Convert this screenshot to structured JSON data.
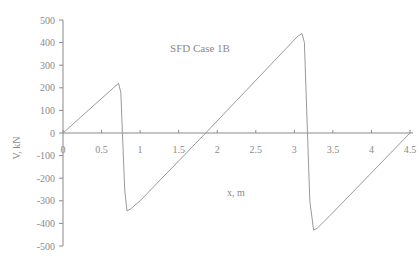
{
  "chart_data": {
    "type": "line",
    "title": "SFD Case 1B",
    "xlabel": "x, m",
    "ylabel": "V, kN",
    "xlim": [
      0,
      4.5
    ],
    "ylim": [
      -500,
      500
    ],
    "x_ticks": [
      0,
      0.5,
      1,
      1.5,
      2,
      2.5,
      3,
      3.5,
      4,
      4.5
    ],
    "x_tick_labels": [
      "0",
      "0.5",
      "1",
      "1.5",
      "2",
      "2.5",
      "3",
      "3.5",
      "4",
      "4.5"
    ],
    "y_ticks": [
      500,
      400,
      300,
      200,
      100,
      0,
      -100,
      -200,
      -300,
      -400,
      -500
    ],
    "y_tick_labels": [
      "500",
      "400",
      "300",
      "200",
      "100",
      "0",
      "-100",
      "-200",
      "-300",
      "-400",
      "-500"
    ],
    "grid": false,
    "legend": null,
    "series": [
      {
        "name": "SFD Case 1B",
        "color": "#9a9a9a",
        "x": [
          0,
          0.72,
          0.75,
          0.8,
          0.83,
          0.88,
          1.0,
          1.85,
          3.05,
          3.1,
          3.13,
          3.2,
          3.25,
          3.3,
          3.45,
          4.5
        ],
        "y": [
          0,
          220,
          180,
          -250,
          -345,
          -335,
          -300,
          0,
          430,
          440,
          400,
          -300,
          -430,
          -420,
          -370,
          0
        ]
      }
    ]
  },
  "layout": {
    "axis_color": "#8a8a8a",
    "line_color": "#9a9a9a"
  }
}
